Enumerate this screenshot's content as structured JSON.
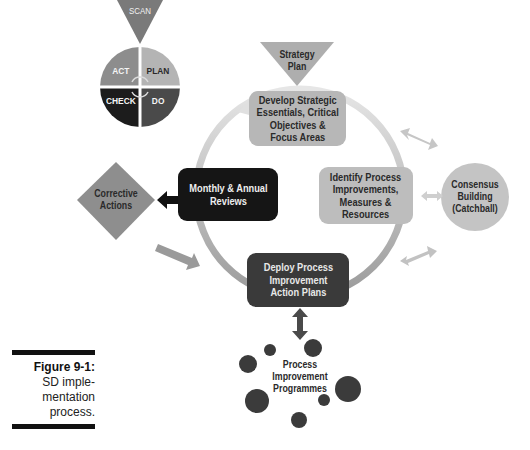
{
  "diagram": {
    "pdca_cycle": {
      "scan_label": "SCAN",
      "quadrants": [
        {
          "label": "ACT",
          "color": "#8d8d8d"
        },
        {
          "label": "PLAN",
          "color": "#b4b4b4"
        },
        {
          "label": "CHECK",
          "color": "#1c1c1c"
        },
        {
          "label": "DO",
          "color": "#4a4a4a"
        }
      ]
    },
    "strategy_plan": {
      "line1": "Strategy",
      "line2": "Plan"
    },
    "nodes": {
      "develop": {
        "text": "Develop Strategic\nEssentials, Critical\nObjectives &\nFocus Areas",
        "color": "#b7b7b7"
      },
      "identify": {
        "text": "Identify Process\nImprovements,\nMeasures &\nResources",
        "color": "#bdbdbd"
      },
      "deploy": {
        "text": "Deploy Process\nImprovement\nAction Plans",
        "color": "#3a3a3a"
      },
      "reviews": {
        "text": "Monthly & Annual\nReviews",
        "color": "#151515"
      }
    },
    "corrective_actions": {
      "line1": "Corrective",
      "line2": "Actions",
      "color": "#8e8e8e"
    },
    "consensus": {
      "line1": "Consensus",
      "line2": "Building",
      "line3": "(Catchball)",
      "color": "#c4c4c4"
    },
    "programmes": {
      "line1": "Process",
      "line2": "Improvement",
      "line3": "Programmes",
      "bubble_color": "#3b3b3b"
    }
  },
  "caption": {
    "title": "Figure 9-1:",
    "line1": "SD imple-",
    "line2": "mentation",
    "line3": "process."
  }
}
